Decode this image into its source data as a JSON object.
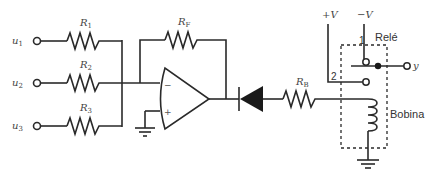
{
  "diagram": {
    "type": "circuit",
    "inputs": [
      {
        "name": "u",
        "sub": "1"
      },
      {
        "name": "u",
        "sub": "2"
      },
      {
        "name": "u",
        "sub": "3"
      }
    ],
    "resistors": {
      "r1": {
        "name": "R",
        "sub": "1"
      },
      "r2": {
        "name": "R",
        "sub": "2"
      },
      "r3": {
        "name": "R",
        "sub": "3"
      },
      "rf": {
        "name": "R",
        "sub": "F"
      },
      "rb": {
        "name": "R",
        "sub": "B"
      }
    },
    "opamp": {
      "minus": "−",
      "plus": "+"
    },
    "supplies": {
      "pos": "+V",
      "neg": "−V"
    },
    "relay": {
      "label": "Relé",
      "coil_label": "Bobina",
      "contact1": "1",
      "contact2": "2",
      "output": "y"
    }
  }
}
